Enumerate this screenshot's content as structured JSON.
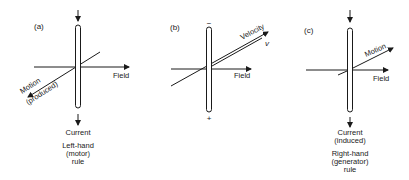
{
  "figure": {
    "panels": [
      {
        "id": "a",
        "label": "(a)",
        "field_label": "Field",
        "motion_label": "Motion",
        "motion_sub": "(produced)",
        "current_label": "Current",
        "rule_lines": [
          "Left-hand",
          "(motor)",
          "rule"
        ]
      },
      {
        "id": "b",
        "label": "(b)",
        "field_label": "Field",
        "velocity_label": "Velocity",
        "velocity_symbol": "v",
        "top_sign": "−",
        "bottom_sign": "+"
      },
      {
        "id": "c",
        "label": "(c)",
        "field_label": "Field",
        "motion_label": "Motion",
        "current_label": "Current",
        "current_sub": "(induced)",
        "rule_lines": [
          "Right-hand",
          "(generator)",
          "rule"
        ]
      }
    ],
    "colors": {
      "ink": "#1a1a1a",
      "background": "#ffffff"
    }
  }
}
